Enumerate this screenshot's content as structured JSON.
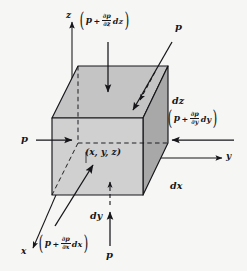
{
  "figure": {
    "background_color": "#f6f6f4",
    "ink_color": "#16161a"
  },
  "cube": {
    "front_face_fill": "#cfcfcf",
    "top_face_fill": "#c2c2c2",
    "right_face_fill": "#a9a9a9",
    "edge_color": "#16161a"
  },
  "axes": [
    {
      "name": "z-axis",
      "label": "z",
      "direction": "up"
    },
    {
      "name": "y-axis",
      "label": "y",
      "direction": "right"
    },
    {
      "name": "x-axis",
      "label": "x",
      "direction": "down-left"
    }
  ],
  "center_point": {
    "label": "(x, y, z)"
  },
  "dimensions": [
    {
      "name": "dz",
      "label": "dz"
    },
    {
      "name": "dx",
      "label": "dx"
    },
    {
      "name": "dy",
      "label": "dy"
    }
  ],
  "pressures": {
    "left_face": {
      "label": "p",
      "face": "left",
      "arrow": "right"
    },
    "top_incoming": {
      "label": "p",
      "face": "top-rear",
      "arrow": "down-left-diagonal"
    },
    "bottom_face": {
      "label": "p",
      "face": "bottom",
      "arrow": "up"
    },
    "top_expression": {
      "base": "p",
      "operator": "+",
      "numerator": "∂p",
      "denominator": "∂z",
      "differential": "dz",
      "face": "top",
      "arrow": "down"
    },
    "right_expression": {
      "base": "p",
      "operator": "+",
      "numerator": "∂p",
      "denominator": "∂y",
      "differential": "dy",
      "face": "right",
      "arrow": "left"
    },
    "front_expression": {
      "base": "p",
      "operator": "+",
      "numerator": "∂p",
      "denominator": "∂x",
      "differential": "dx",
      "face": "front",
      "arrow": "up-right-diagonal"
    }
  }
}
